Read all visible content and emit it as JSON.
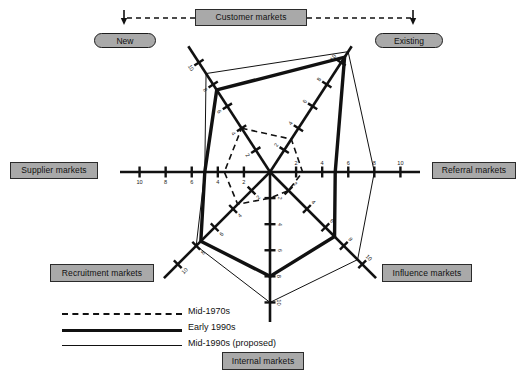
{
  "figure": {
    "type": "radar",
    "title": "",
    "center": [
      270,
      172
    ],
    "max_value": 11.5,
    "radius_px": 150
  },
  "top_group": {
    "label": "Customer markets",
    "arrow_left_name": "arrow-down-new",
    "arrow_right_name": "arrow-down-existing",
    "children": [
      {
        "label": "New"
      },
      {
        "label": "Existing"
      }
    ]
  },
  "axis_labels": {
    "supplier": "Supplier markets",
    "referral": "Referral markets",
    "recruitment": "Recruitment markets",
    "influence": "Influence markets",
    "internal": "Internal markets",
    "new": "New",
    "existing": "Existing"
  },
  "legend": {
    "position": "bottom-left",
    "items": [
      {
        "label": "Mid-1970s",
        "style": "dashed"
      },
      {
        "label": "Early 1990s",
        "style": "thick"
      },
      {
        "label": "Mid-1990s (proposed)",
        "style": "thin"
      }
    ]
  },
  "chart_data": {
    "type": "radar",
    "xlabel": "",
    "ylabel": "",
    "grid": false,
    "legend_position": "bottom-left",
    "axis_scale": {
      "ticks": [
        2,
        4,
        6,
        8,
        10
      ],
      "tick_labels": [
        "2",
        "4",
        "6",
        "8",
        "10"
      ],
      "min": 0,
      "max": 11.5,
      "direction": "center is 0, outward increases"
    },
    "axes": [
      {
        "key": "new",
        "label": "New (customer markets)",
        "angle_deg": 123,
        "tick_labels": [
          "2",
          "4",
          "6",
          "8",
          "10"
        ]
      },
      {
        "key": "existing",
        "label": "Existing (customer markets)",
        "angle_deg": 57,
        "tick_labels": [
          "2",
          "4",
          "6",
          "8",
          "10"
        ]
      },
      {
        "key": "referral",
        "label": "Referral markets",
        "angle_deg": 0,
        "tick_labels": [
          "2",
          "4",
          "6",
          "8",
          "10"
        ]
      },
      {
        "key": "influence",
        "label": "Influence markets",
        "angle_deg": -45,
        "tick_labels": [
          "2",
          "4",
          "6",
          "8",
          "10"
        ]
      },
      {
        "key": "internal",
        "label": "Internal markets",
        "angle_deg": -90,
        "tick_labels": [
          "2",
          "4",
          "6",
          "8",
          "10"
        ]
      },
      {
        "key": "recruitment",
        "label": "Recruitment markets",
        "angle_deg": -135,
        "tick_labels": [
          "2",
          "4",
          "6",
          "8",
          "10"
        ]
      },
      {
        "key": "supplier",
        "label": "Supplier markets",
        "angle_deg": 180,
        "tick_labels": [
          "2",
          "4",
          "6",
          "8",
          "10"
        ]
      }
    ],
    "series": [
      {
        "name": "Mid-1970s",
        "style": "dashed",
        "values": {
          "new": 4.0,
          "existing": 3.0,
          "referral": 2.5,
          "influence": 2.0,
          "internal": 2.0,
          "recruitment": 3.5,
          "supplier": 3.5
        }
      },
      {
        "name": "Early 1990s",
        "style": "thick",
        "values": {
          "new": 7.5,
          "existing": 10.5,
          "referral": 5.0,
          "influence": 7.0,
          "internal": 8.0,
          "recruitment": 7.5,
          "supplier": 5.0
        }
      },
      {
        "name": "Mid-1990s (proposed)",
        "style": "thin",
        "values": {
          "new": 9.0,
          "existing": 11.0,
          "referral": 8.0,
          "influence": 9.5,
          "internal": 10.0,
          "recruitment": 8.0,
          "supplier": 5.0
        }
      }
    ]
  }
}
